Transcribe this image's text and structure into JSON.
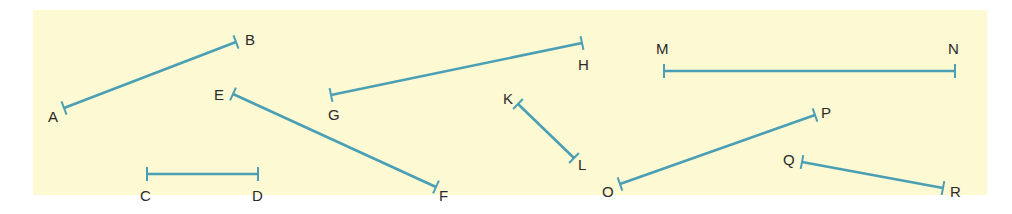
{
  "diagram": {
    "title": "",
    "background_color": "#fdf9d3",
    "segment_color": "#4a9fb5",
    "label_color": "#2a2a2a",
    "segments": [
      {
        "name": "AB",
        "p1": {
          "label": "A",
          "x": 64,
          "y": 108,
          "lx": 48,
          "ly": 122
        },
        "p2": {
          "label": "B",
          "x": 236,
          "y": 42,
          "lx": 245,
          "ly": 45
        }
      },
      {
        "name": "CD",
        "p1": {
          "label": "C",
          "x": 147,
          "y": 174,
          "lx": 140,
          "ly": 201
        },
        "p2": {
          "label": "D",
          "x": 258,
          "y": 174,
          "lx": 252,
          "ly": 201
        }
      },
      {
        "name": "EF",
        "p1": {
          "label": "E",
          "x": 233,
          "y": 94,
          "lx": 214,
          "ly": 100
        },
        "p2": {
          "label": "F",
          "x": 436,
          "y": 187,
          "lx": 439,
          "ly": 201
        }
      },
      {
        "name": "GH",
        "p1": {
          "label": "G",
          "x": 331,
          "y": 95,
          "lx": 328,
          "ly": 120
        },
        "p2": {
          "label": "H",
          "x": 582,
          "y": 43,
          "lx": 578,
          "ly": 70
        }
      },
      {
        "name": "KL",
        "p1": {
          "label": "K",
          "x": 518,
          "y": 104,
          "lx": 503,
          "ly": 104
        },
        "p2": {
          "label": "L",
          "x": 574,
          "y": 158,
          "lx": 578,
          "ly": 170
        }
      },
      {
        "name": "MN",
        "p1": {
          "label": "M",
          "x": 664,
          "y": 71,
          "lx": 656,
          "ly": 54
        },
        "p2": {
          "label": "N",
          "x": 955,
          "y": 71,
          "lx": 948,
          "ly": 54
        }
      },
      {
        "name": "OP",
        "p1": {
          "label": "O",
          "x": 620,
          "y": 184,
          "lx": 602,
          "ly": 197
        },
        "p2": {
          "label": "P",
          "x": 815,
          "y": 115,
          "lx": 821,
          "ly": 118
        }
      },
      {
        "name": "QR",
        "p1": {
          "label": "Q",
          "x": 802,
          "y": 162,
          "lx": 783,
          "ly": 165
        },
        "p2": {
          "label": "R",
          "x": 943,
          "y": 188,
          "lx": 950,
          "ly": 197
        }
      }
    ]
  }
}
